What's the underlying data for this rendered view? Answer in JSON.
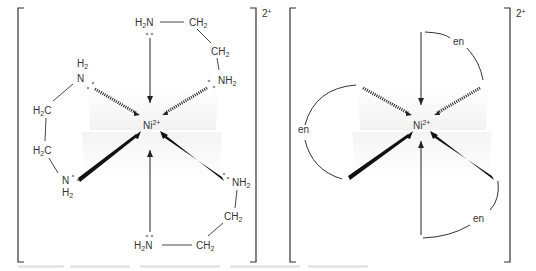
{
  "figure": {
    "left_panel": {
      "title": "[Ni(en)3]2+ full structure",
      "charge": "2+",
      "center": {
        "element": "Ni",
        "charge": "2+"
      },
      "labels": {
        "top_n": "H2N",
        "top_ch2_a": "CH2",
        "top_ch2_b": "CH2",
        "upper_right_n": "NH2",
        "upper_left_n_h": "H2",
        "upper_left_n": "N",
        "left_ch2_a": "H2C",
        "left_ch2_b": "H2C",
        "lower_left_n": "N",
        "lower_left_n_h": "H2",
        "lower_right_n": "NH2",
        "bottom_ch2_a": "CH2",
        "bottom_n": "H2N",
        "bottom_ch2_b": "CH2"
      }
    },
    "right_panel": {
      "title": "[Ni(en)3]2+ abbreviated",
      "charge": "2+",
      "center": {
        "element": "Ni",
        "charge": "2+"
      },
      "ligands": [
        {
          "label": "en",
          "position": "top-right"
        },
        {
          "label": "en",
          "position": "left"
        },
        {
          "label": "en",
          "position": "bottom-right"
        }
      ]
    },
    "colors": {
      "bond": "#222222",
      "text": "#333333",
      "lone_pair": "#999999",
      "plane_shade": "#f3f3f3",
      "bracket": "#333333"
    }
  }
}
